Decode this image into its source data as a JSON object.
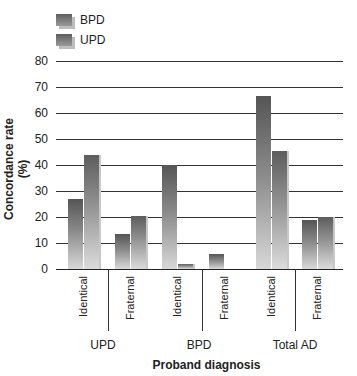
{
  "chart_data": {
    "type": "bar",
    "title": "",
    "xlabel": "Proband diagnosis",
    "ylabel": "Concordance rate (%)",
    "ylim": [
      0,
      80
    ],
    "yticks": [
      0,
      10,
      20,
      30,
      40,
      50,
      60,
      70,
      80
    ],
    "grid": true,
    "legend_position": "top-left",
    "groups": [
      "UPD",
      "BPD",
      "Total AD"
    ],
    "categories": [
      "Identical",
      "Fraternal",
      "Identical",
      "Fraternal",
      "Identical",
      "Fraternal"
    ],
    "category_groups": [
      "UPD",
      "UPD",
      "BPD",
      "BPD",
      "Total AD",
      "Total AD"
    ],
    "series": [
      {
        "name": "BPD",
        "values": [
          27,
          13.5,
          40,
          5.6,
          66.7,
          19
        ]
      },
      {
        "name": "UPD",
        "values": [
          44,
          20.5,
          2,
          0,
          45.5,
          20
        ]
      }
    ]
  },
  "legend": {
    "items": [
      {
        "label": "BPD"
      },
      {
        "label": "UPD"
      }
    ]
  },
  "axis": {
    "ylabel": "Concordance rate (%)",
    "xlabel": "Proband diagnosis",
    "yticks": [
      "0",
      "10",
      "20",
      "30",
      "40",
      "50",
      "60",
      "70",
      "80"
    ],
    "xticks": [
      "Identical",
      "Fraternal",
      "Identical",
      "Fraternal",
      "Identical",
      "Fraternal"
    ],
    "groups": [
      "UPD",
      "BPD",
      "Total AD"
    ]
  }
}
